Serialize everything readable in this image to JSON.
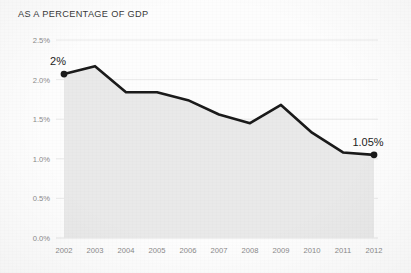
{
  "chart_data": {
    "type": "line",
    "title": "AS A PERCENTAGE OF GDP",
    "xlabel": "",
    "ylabel": "",
    "categories": [
      "2002",
      "2003",
      "2004",
      "2005",
      "2006",
      "2007",
      "2008",
      "2009",
      "2010",
      "2011",
      "2012"
    ],
    "values": [
      2.07,
      2.17,
      1.84,
      1.84,
      1.74,
      1.56,
      1.45,
      1.68,
      1.33,
      1.08,
      1.05
    ],
    "ylim": [
      0.0,
      2.5
    ],
    "ytick_labels": [
      "2.5%",
      "2.0%",
      "1.5%",
      "1.0%",
      "0.5%",
      "0.0%"
    ],
    "ytick_values": [
      2.5,
      2.0,
      1.5,
      1.0,
      0.5,
      0.0
    ],
    "grid": true,
    "legend": false,
    "area_fill": true,
    "annotations": [
      {
        "label": "2%",
        "category": "2002",
        "value": 2.07,
        "position": "above-left"
      },
      {
        "label": "1.05%",
        "category": "2012",
        "value": 1.05,
        "position": "above-left"
      }
    ],
    "markers": [
      {
        "category": "2002",
        "value": 2.07
      },
      {
        "category": "2012",
        "value": 1.05
      }
    ],
    "colors": {
      "line": "#1a1a1a",
      "fill": "#e9e9e9",
      "grid": "#e4e4e4",
      "axis_text": "#8a8a8a",
      "title_text": "#3a3a3a",
      "annotation_text": "#1c1c1c",
      "background": "#fdfdfd"
    }
  }
}
